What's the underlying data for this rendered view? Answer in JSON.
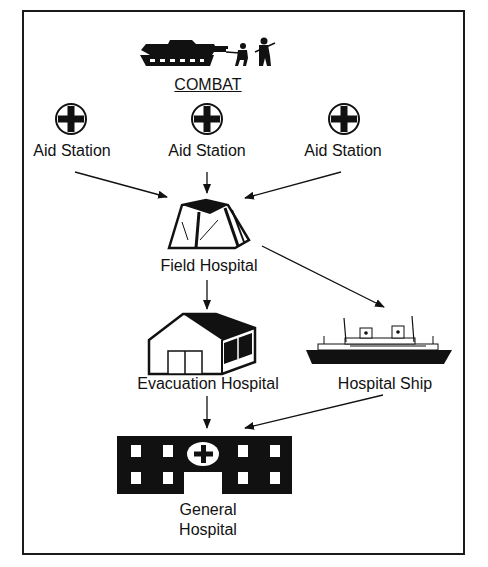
{
  "diagram": {
    "combat": {
      "label": "COMBAT",
      "icon": "tank-and-soldiers-icon"
    },
    "aid_stations": [
      {
        "label": "Aid Station",
        "icon": "red-cross-circle-icon"
      },
      {
        "label": "Aid Station",
        "icon": "red-cross-circle-icon"
      },
      {
        "label": "Aid Station",
        "icon": "red-cross-circle-icon"
      }
    ],
    "field_hospital": {
      "label": "Field Hospital",
      "icon": "tent-icon"
    },
    "evacuation_hospital": {
      "label": "Evacuation Hospital",
      "icon": "building-icon"
    },
    "hospital_ship": {
      "label": "Hospital Ship",
      "icon": "ship-icon"
    },
    "general_hospital": {
      "label_line1": "General",
      "label_line2": "Hospital",
      "icon": "hospital-building-icon"
    },
    "edges": [
      {
        "from": "Aid Station 1",
        "to": "Field Hospital"
      },
      {
        "from": "Aid Station 2",
        "to": "Field Hospital"
      },
      {
        "from": "Aid Station 3",
        "to": "Field Hospital"
      },
      {
        "from": "Field Hospital",
        "to": "Evacuation Hospital"
      },
      {
        "from": "Field Hospital",
        "to": "Hospital Ship"
      },
      {
        "from": "Evacuation Hospital",
        "to": "General Hospital"
      },
      {
        "from": "Hospital Ship",
        "to": "General Hospital"
      }
    ]
  }
}
